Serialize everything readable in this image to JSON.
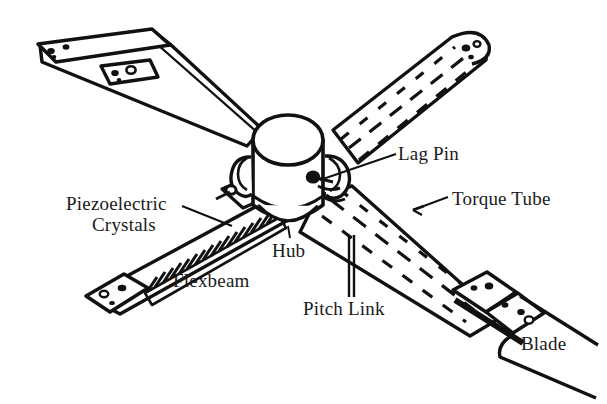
{
  "figure": {
    "background_color": "#ffffff",
    "ink_color": "#111111",
    "text_color": "#1a1a1a"
  },
  "labels": {
    "piezoelectric_line1": "Piezoelectric",
    "piezoelectric_line2": "Crystals",
    "flexbeam": "Flexbeam",
    "hub": "Hub",
    "lag_pin": "Lag Pin",
    "torque_tube": "Torque Tube",
    "pitch_link": "Pitch Link",
    "blade": "Blade"
  },
  "parts": [
    {
      "name": "hub",
      "description": "central vertical cylinder with elliptical top"
    },
    {
      "name": "upper-left-arm",
      "description": "flexbeam arm with root fitting and bolt holes"
    },
    {
      "name": "upper-right-arm",
      "description": "torque tube with dashed hidden lines and rounded bolted tip"
    },
    {
      "name": "lower-left-arm",
      "description": "flexbeam with hatched piezoelectric crystal stack"
    },
    {
      "name": "lower-right-arm",
      "description": "torque tube with dashed hidden lines, blade attachment fittings and blade"
    },
    {
      "name": "pitch-link",
      "description": "vertical two-line rod below hub"
    },
    {
      "name": "lag-pin",
      "description": "small pin circle at right hub bracket"
    }
  ]
}
